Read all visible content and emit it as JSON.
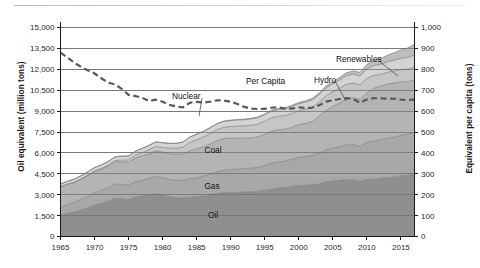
{
  "chart_data": {
    "type": "area",
    "title": "",
    "subtitle": "",
    "xlabel": "",
    "ylabel": "Oil equivalent (million tons)",
    "ylabel_right": "Equivalent per capita (tons)",
    "xlim": [
      1965,
      2017
    ],
    "ylim": [
      0,
      15000
    ],
    "ylim_right": [
      0,
      1000
    ],
    "grid": true,
    "legend_position": "inline-annotations",
    "stacked": true,
    "x": [
      1965,
      1966,
      1967,
      1968,
      1969,
      1970,
      1971,
      1972,
      1973,
      1974,
      1975,
      1976,
      1977,
      1978,
      1979,
      1980,
      1981,
      1982,
      1983,
      1984,
      1985,
      1986,
      1987,
      1988,
      1989,
      1990,
      1991,
      1992,
      1993,
      1994,
      1995,
      1996,
      1997,
      1998,
      1999,
      2000,
      2001,
      2002,
      2003,
      2004,
      2005,
      2006,
      2007,
      2008,
      2009,
      2010,
      2011,
      2012,
      2013,
      2014,
      2015,
      2016,
      2017
    ],
    "xticks": [
      1965,
      1970,
      1975,
      1980,
      1985,
      1990,
      1995,
      2000,
      2005,
      2010,
      2015
    ],
    "yticks": [
      0,
      1500,
      3000,
      4500,
      6000,
      7500,
      9000,
      10500,
      12000,
      13500,
      15000
    ],
    "yticks_right": [
      0,
      100,
      200,
      300,
      400,
      500,
      600,
      700,
      800,
      900,
      1000
    ],
    "ytick_labels": [
      "0",
      "1,500",
      "3,000",
      "4,500",
      "6,000",
      "7,500",
      "9,000",
      "10,500",
      "12,000",
      "13,500",
      "15,000"
    ],
    "ytick_labels_right": [
      "0",
      "100",
      "200",
      "300",
      "400",
      "500",
      "600",
      "700",
      "800",
      "900",
      "1,000"
    ],
    "xtick_labels": [
      "1965",
      "1970",
      "1975",
      "1980",
      "1985",
      "1990",
      "1995",
      "2000",
      "2005",
      "2010",
      "2015"
    ],
    "series": [
      {
        "name": "Oil",
        "label": "Oil",
        "color": "#8f8f8f",
        "values": [
          1530,
          1650,
          1760,
          1900,
          2050,
          2250,
          2380,
          2520,
          2740,
          2700,
          2650,
          2830,
          2910,
          3000,
          3060,
          2970,
          2860,
          2790,
          2760,
          2820,
          2830,
          2930,
          3000,
          3090,
          3150,
          3160,
          3170,
          3200,
          3200,
          3250,
          3310,
          3400,
          3490,
          3520,
          3610,
          3650,
          3680,
          3700,
          3780,
          3930,
          3990,
          4030,
          4070,
          4060,
          3980,
          4090,
          4130,
          4180,
          4220,
          4270,
          4350,
          4400,
          4450
        ]
      },
      {
        "name": "Gas",
        "label": "Gas",
        "color": "#a8a8a8",
        "values": [
          590,
          640,
          690,
          750,
          820,
          880,
          930,
          980,
          1020,
          1040,
          1040,
          1100,
          1130,
          1180,
          1250,
          1240,
          1240,
          1250,
          1260,
          1340,
          1370,
          1400,
          1470,
          1540,
          1600,
          1640,
          1670,
          1680,
          1700,
          1710,
          1780,
          1860,
          1860,
          1890,
          1940,
          2030,
          2060,
          2120,
          2200,
          2280,
          2350,
          2410,
          2500,
          2540,
          2470,
          2640,
          2710,
          2770,
          2820,
          2850,
          2900,
          2950,
          3010
        ]
      },
      {
        "name": "Coal",
        "label": "Coal",
        "color": "#b4b4b4",
        "values": [
          1440,
          1450,
          1420,
          1450,
          1500,
          1520,
          1520,
          1540,
          1590,
          1610,
          1630,
          1700,
          1740,
          1760,
          1840,
          1850,
          1840,
          1860,
          1900,
          2000,
          2080,
          2110,
          2180,
          2250,
          2280,
          2250,
          2210,
          2180,
          2180,
          2190,
          2240,
          2300,
          2320,
          2290,
          2280,
          2340,
          2380,
          2440,
          2660,
          2830,
          2980,
          3140,
          3300,
          3370,
          3390,
          3570,
          3790,
          3840,
          3890,
          3890,
          3840,
          3760,
          3790
        ]
      },
      {
        "name": "Nuclear",
        "label": "Nuclear",
        "color": "#c6c6c6",
        "values": [
          10,
          14,
          20,
          27,
          35,
          45,
          60,
          80,
          100,
          130,
          170,
          200,
          240,
          280,
          310,
          340,
          400,
          430,
          490,
          590,
          660,
          700,
          740,
          790,
          810,
          840,
          870,
          880,
          900,
          920,
          940,
          960,
          960,
          970,
          1000,
          1000,
          1010,
          1020,
          1010,
          1050,
          1060,
          1060,
          1050,
          1040,
          1030,
          1040,
          940,
          830,
          850,
          870,
          890,
          910,
          930
        ]
      },
      {
        "name": "Hydro",
        "label": "Hydro",
        "color": "#d4d4d4",
        "values": [
          200,
          210,
          220,
          230,
          240,
          250,
          255,
          265,
          270,
          285,
          290,
          295,
          305,
          320,
          325,
          330,
          340,
          350,
          370,
          385,
          395,
          400,
          410,
          420,
          420,
          430,
          440,
          440,
          455,
          460,
          470,
          480,
          480,
          490,
          500,
          510,
          510,
          520,
          530,
          560,
          570,
          590,
          620,
          640,
          650,
          690,
          700,
          730,
          760,
          780,
          800,
          830,
          850
        ]
      },
      {
        "name": "Renewables",
        "label": "Renewables",
        "color": "#bdbdbd",
        "values": [
          0,
          0,
          0,
          0,
          0,
          0,
          0,
          0,
          0,
          0,
          0,
          1,
          2,
          3,
          4,
          5,
          7,
          9,
          11,
          14,
          17,
          20,
          23,
          26,
          30,
          34,
          38,
          42,
          47,
          52,
          58,
          64,
          71,
          78,
          86,
          95,
          104,
          115,
          128,
          143,
          160,
          180,
          205,
          235,
          265,
          310,
          360,
          410,
          470,
          530,
          600,
          680,
          760
        ]
      }
    ],
    "per_capita_line": {
      "name": "Per Capita",
      "label": "Per Capita",
      "color": "#595959",
      "style": "dashed",
      "axis": "right",
      "unit": "tons",
      "values": [
        880,
        857,
        832,
        812,
        795,
        780,
        757,
        736,
        728,
        706,
        678,
        672,
        664,
        648,
        655,
        645,
        630,
        622,
        618,
        640,
        644,
        641,
        645,
        652,
        650,
        645,
        634,
        620,
        612,
        610,
        611,
        616,
        618,
        612,
        612,
        618,
        615,
        617,
        628,
        645,
        652,
        658,
        662,
        658,
        640,
        655,
        662,
        661,
        660,
        659,
        655,
        653,
        655
      ]
    },
    "annotations": [
      {
        "text": "Renewables",
        "x": 2007,
        "y_value": 13050,
        "leader": true
      },
      {
        "text": "Hydro",
        "x": 2002,
        "y_value": 11400,
        "leader": true
      },
      {
        "text": "Per Capita",
        "x": 1996,
        "y_value": 11400,
        "leader": false
      },
      {
        "text": "Nuclear",
        "x": 1993,
        "y_value": 9550,
        "leader": true
      },
      {
        "text": "Coal",
        "x": 1994,
        "y_value": 6450,
        "leader": false
      },
      {
        "text": "Gas",
        "x": 1992,
        "y_value": 3850,
        "leader": false
      },
      {
        "text": "Oil",
        "x": 1990,
        "y_value": 1900,
        "leader": false
      }
    ]
  },
  "axes": {
    "left_title": "Oil equivalent (million tons)",
    "right_title": "Equivalent per capita (tons)"
  }
}
